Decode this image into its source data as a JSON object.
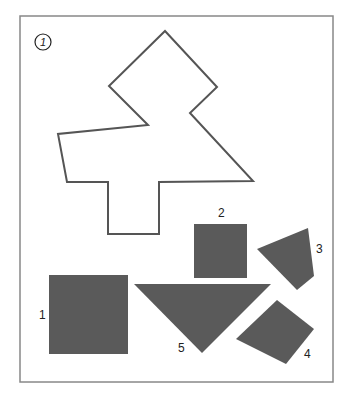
{
  "puzzle": {
    "badge_number": "1",
    "frame": {
      "x": 20,
      "y": 16,
      "width": 313,
      "height": 366,
      "stroke": "#888888"
    },
    "outline": {
      "name": "target-silhouette",
      "stroke": "#555555",
      "points": "165,31 217,87 190,113 253,181 159,182 159,234 108,234 108,182 67,182 58,134 148,125 109,86"
    },
    "fill_color": "#5a5a5a",
    "pieces": [
      {
        "id": "1",
        "label": "1",
        "shape": "square",
        "points": "49,275 128,275 128,354 49,354",
        "label_x": 39,
        "label_y": 319
      },
      {
        "id": "2",
        "label": "2",
        "shape": "square",
        "points": "194,224 247,224 247,278 194,278",
        "label_x": 218,
        "label_y": 217
      },
      {
        "id": "3",
        "label": "3",
        "shape": "quadrilateral",
        "points": "257,249 308,228 314,276 297,290",
        "label_x": 316,
        "label_y": 253
      },
      {
        "id": "4",
        "label": "4",
        "shape": "quadrilateral",
        "points": "277,300 314,329 286,364 236,339",
        "label_x": 304,
        "label_y": 358
      },
      {
        "id": "5",
        "label": "5",
        "shape": "right-triangle",
        "points": "134,284 271,284 202,353",
        "label_x": 178,
        "label_y": 352
      }
    ]
  }
}
